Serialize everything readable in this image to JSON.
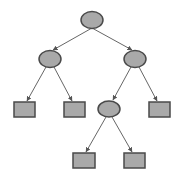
{
  "diagram": {
    "type": "binary-tree",
    "colors": {
      "background": "#ffffff",
      "node_fill": "#a9a9a9",
      "node_stroke": "#4a4a4a",
      "edge": "#666666"
    },
    "nodes": [
      {
        "id": "root",
        "shape": "ellipse",
        "cx": 92,
        "cy": 20,
        "rx": 11,
        "ry": 8.5
      },
      {
        "id": "left",
        "shape": "ellipse",
        "cx": 50,
        "cy": 59,
        "rx": 11,
        "ry": 8.5
      },
      {
        "id": "right",
        "shape": "ellipse",
        "cx": 135,
        "cy": 59,
        "rx": 11,
        "ry": 8.5
      },
      {
        "id": "left-left",
        "shape": "rect",
        "x": 14,
        "y": 102,
        "w": 21,
        "h": 15
      },
      {
        "id": "left-right",
        "shape": "rect",
        "x": 64,
        "y": 102,
        "w": 21,
        "h": 15
      },
      {
        "id": "right-left",
        "shape": "ellipse",
        "cx": 109,
        "cy": 109,
        "rx": 11,
        "ry": 8
      },
      {
        "id": "right-right",
        "shape": "rect",
        "x": 149,
        "y": 102,
        "w": 21,
        "h": 15
      },
      {
        "id": "right-left-left",
        "shape": "rect",
        "x": 73,
        "y": 153,
        "w": 22,
        "h": 15
      },
      {
        "id": "right-left-right",
        "shape": "rect",
        "x": 124,
        "y": 153,
        "w": 21,
        "h": 15
      }
    ],
    "edges": [
      {
        "from": "root",
        "to": "left",
        "x1": 92,
        "y1": 28,
        "x2": 53,
        "y2": 50
      },
      {
        "from": "root",
        "to": "right",
        "x1": 92,
        "y1": 28,
        "x2": 132,
        "y2": 50
      },
      {
        "from": "left",
        "to": "left-left",
        "x1": 46,
        "y1": 67,
        "x2": 27,
        "y2": 101
      },
      {
        "from": "left",
        "to": "left-right",
        "x1": 54,
        "y1": 67,
        "x2": 72,
        "y2": 101
      },
      {
        "from": "right",
        "to": "right-left",
        "x1": 131,
        "y1": 67,
        "x2": 113,
        "y2": 100
      },
      {
        "from": "right",
        "to": "right-right",
        "x1": 139,
        "y1": 67,
        "x2": 157,
        "y2": 101
      },
      {
        "from": "right-left",
        "to": "right-left-left",
        "x1": 106,
        "y1": 117,
        "x2": 86,
        "y2": 152
      },
      {
        "from": "right-left",
        "to": "right-left-right",
        "x1": 112,
        "y1": 117,
        "x2": 132,
        "y2": 152
      }
    ]
  }
}
